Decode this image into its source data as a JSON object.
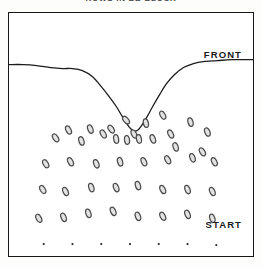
{
  "caption": {
    "text": "ROWS IN BB BLOCK"
  },
  "plate": {
    "labels": {
      "front": "FRONT",
      "start": "START"
    },
    "colors": {
      "border": "#17171a",
      "background": "#ffffff",
      "front_curve": "#1b1b1d",
      "marker_stroke": "#4a4a4a",
      "marker_fill": "#e2e2e2",
      "start_dot": "#2a2a2a"
    }
  },
  "chart_data": {
    "type": "scatter",
    "title": "ROWS IN BB BLOCK",
    "xlabel": "",
    "ylabel": "",
    "xlim": [
      0,
      246
    ],
    "ylim": [
      0,
      245
    ],
    "grid": false,
    "legend": null,
    "annotations": [
      {
        "text": "FRONT",
        "x": 214,
        "y": 41
      },
      {
        "text": "START",
        "x": 214,
        "y": 211
      }
    ],
    "series": [
      {
        "name": "front-curve",
        "type": "line",
        "note": "Advancing front: flat at left, deep V-shaped notch at center, rising to flat at right",
        "points": [
          [
            0,
            52
          ],
          [
            14,
            52
          ],
          [
            28,
            53
          ],
          [
            42,
            55
          ],
          [
            54,
            56
          ],
          [
            64,
            56
          ],
          [
            74,
            58
          ],
          [
            84,
            64
          ],
          [
            92,
            73
          ],
          [
            100,
            83
          ],
          [
            108,
            94
          ],
          [
            114,
            104
          ],
          [
            119,
            112
          ],
          [
            123,
            117
          ],
          [
            126,
            119
          ],
          [
            130,
            118
          ],
          [
            134,
            113
          ],
          [
            139,
            105
          ],
          [
            145,
            94
          ],
          [
            152,
            82
          ],
          [
            159,
            71
          ],
          [
            167,
            62
          ],
          [
            176,
            55
          ],
          [
            186,
            51
          ],
          [
            196,
            49
          ],
          [
            210,
            48
          ],
          [
            224,
            47
          ],
          [
            238,
            47
          ],
          [
            246,
            47
          ]
        ]
      },
      {
        "name": "grain-markers",
        "type": "scatter",
        "marker": "ellipse",
        "note": "Tilted open ellipses scattered below the front, denser toward center, arranged in rough rows",
        "points": [
          [
            155,
            103,
            -28
          ],
          [
            183,
            110,
            -16
          ],
          [
            200,
            120,
            -22
          ],
          [
            118,
            108,
            -40
          ],
          [
            138,
            111,
            -12
          ],
          [
            195,
            140,
            -30
          ],
          [
            168,
            135,
            -18
          ],
          [
            103,
            117,
            -34
          ],
          [
            126,
            122,
            -25
          ],
          [
            108,
            127,
            -10
          ],
          [
            119,
            128,
            -8
          ],
          [
            131,
            127,
            -12
          ],
          [
            145,
            127,
            -20
          ],
          [
            163,
            122,
            -26
          ],
          [
            95,
            122,
            -30
          ],
          [
            82,
            117,
            -22
          ],
          [
            60,
            118,
            -26
          ],
          [
            47,
            126,
            -34
          ],
          [
            73,
            129,
            -18
          ],
          [
            37,
            152,
            -30
          ],
          [
            62,
            150,
            -26
          ],
          [
            88,
            152,
            -20
          ],
          [
            112,
            150,
            -16
          ],
          [
            136,
            150,
            -24
          ],
          [
            160,
            148,
            -28
          ],
          [
            185,
            146,
            -20
          ],
          [
            207,
            150,
            -26
          ],
          [
            34,
            178,
            -30
          ],
          [
            57,
            180,
            -24
          ],
          [
            83,
            176,
            -18
          ],
          [
            108,
            176,
            -22
          ],
          [
            130,
            174,
            -16
          ],
          [
            155,
            178,
            -26
          ],
          [
            180,
            178,
            -20
          ],
          [
            205,
            180,
            -24
          ],
          [
            30,
            207,
            -28
          ],
          [
            55,
            206,
            -22
          ],
          [
            80,
            202,
            -18
          ],
          [
            105,
            200,
            -24
          ],
          [
            130,
            205,
            -20
          ],
          [
            155,
            205,
            -26
          ],
          [
            180,
            203,
            -22
          ],
          [
            205,
            207,
            -18
          ]
        ]
      },
      {
        "name": "start-row",
        "type": "scatter",
        "marker": "dot",
        "note": "Seven small solid dots marking the START line",
        "points": [
          [
            35,
            233
          ],
          [
            64,
            233
          ],
          [
            93,
            233
          ],
          [
            122,
            233
          ],
          [
            151,
            233
          ],
          [
            180,
            233
          ],
          [
            209,
            234
          ]
        ]
      }
    ]
  }
}
